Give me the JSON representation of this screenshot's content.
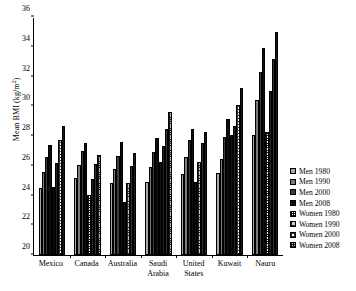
{
  "chart_data": {
    "type": "bar",
    "title": "",
    "xlabel": "",
    "ylabel": "Mean BMI (kg/m²)",
    "ylim": [
      20,
      36
    ],
    "yticks": [
      20,
      22,
      24,
      26,
      28,
      30,
      32,
      34,
      36
    ],
    "grid": false,
    "legend_position": "right",
    "categories": [
      "Mexico",
      "Canada",
      "Australia",
      "Saudi Arabia",
      "United States",
      "Kuwait",
      "Nauru"
    ],
    "series": [
      {
        "name": "Men 1980",
        "key": "m80",
        "values": [
          24.5,
          25.15,
          24.85,
          24.9,
          25.45,
          25.5,
          28.1
        ]
      },
      {
        "name": "Men 1990",
        "key": "m90",
        "values": [
          25.6,
          26.05,
          25.8,
          25.9,
          26.6,
          26.45,
          30.4
        ]
      },
      {
        "name": "Men 2000",
        "key": "m00",
        "values": [
          26.6,
          27.0,
          26.65,
          26.9,
          27.7,
          27.95,
          32.3
        ]
      },
      {
        "name": "Men 2008",
        "key": "m08",
        "values": [
          27.4,
          27.5,
          27.6,
          27.9,
          28.45,
          29.15,
          33.9
        ]
      },
      {
        "name": "Women 1980",
        "key": "w80",
        "values": [
          24.6,
          24.05,
          23.55,
          26.25,
          24.9,
          28.05,
          28.3
        ]
      },
      {
        "name": "Women 1990",
        "key": "w90",
        "values": [
          26.2,
          25.1,
          24.85,
          27.3,
          26.25,
          28.65,
          31.05
        ]
      },
      {
        "name": "Women 2000",
        "key": "w00",
        "values": [
          27.75,
          26.1,
          26.0,
          28.45,
          27.55,
          30.1,
          33.2
        ]
      },
      {
        "name": "Women 2008",
        "key": "w08",
        "values": [
          28.7,
          26.7,
          26.85,
          29.6,
          28.3,
          31.2,
          35.0
        ]
      }
    ]
  },
  "axis": {
    "y_label_text": "Mean BMI (kg/m",
    "y_label_sup": "2",
    "y_label_tail": ")"
  }
}
